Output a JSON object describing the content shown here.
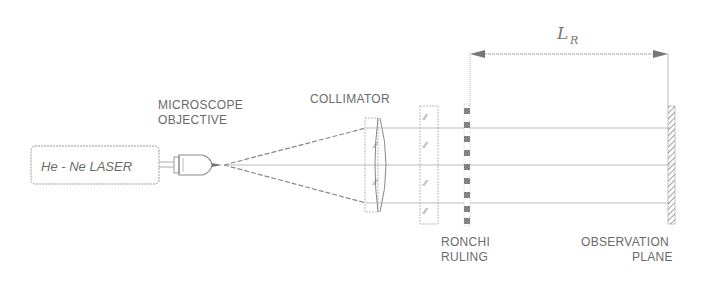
{
  "diagram": {
    "components": {
      "laser": {
        "label": "He - Ne LASER"
      },
      "objective": {
        "label_line1": "MICROSCOPE",
        "label_line2": "OBJECTIVE"
      },
      "collimator": {
        "label": "COLLIMATOR"
      },
      "ronchi": {
        "label_line1": "RONCHI",
        "label_line2": "RULING"
      },
      "observation": {
        "label_line1": "OBSERVATION",
        "label_line2": "PLANE"
      }
    },
    "dimension": {
      "symbol": "L",
      "subscript": "R"
    },
    "colors": {
      "line": "#9a9a9a",
      "text": "#6b6b6b",
      "ruling": "#7a7a7a"
    }
  }
}
